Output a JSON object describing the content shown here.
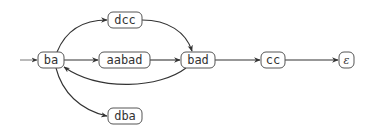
{
  "diagram": {
    "type": "state-transition-graph",
    "nodes": [
      {
        "id": "ba",
        "label": "ba",
        "initial": true
      },
      {
        "id": "dcc",
        "label": "dcc"
      },
      {
        "id": "aabad",
        "label": "aabad"
      },
      {
        "id": "bad",
        "label": "bad"
      },
      {
        "id": "cc",
        "label": "cc"
      },
      {
        "id": "eps",
        "label": "ε"
      },
      {
        "id": "dba",
        "label": "dba"
      }
    ],
    "edges": [
      {
        "from": "start",
        "to": "ba"
      },
      {
        "from": "ba",
        "to": "dcc"
      },
      {
        "from": "ba",
        "to": "aabad"
      },
      {
        "from": "ba",
        "to": "dba"
      },
      {
        "from": "dcc",
        "to": "bad"
      },
      {
        "from": "aabad",
        "to": "bad"
      },
      {
        "from": "bad",
        "to": "ba"
      },
      {
        "from": "bad",
        "to": "cc"
      },
      {
        "from": "cc",
        "to": "eps"
      }
    ],
    "colors": {
      "node_border": "#555555",
      "edge": "#333333",
      "text": "#333333",
      "background": "#ffffff"
    }
  }
}
